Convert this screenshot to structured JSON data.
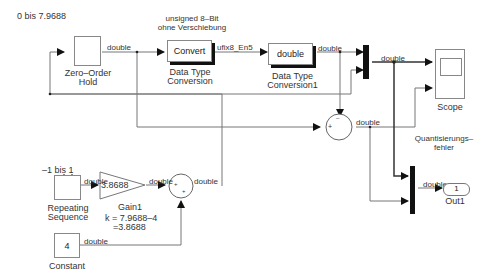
{
  "diagram": {
    "annotations": {
      "range_top": "0 bis 7.9688",
      "conversion_note_1": "unsigned 8–Bit",
      "conversion_note_2": "ohne Verschiebung",
      "range_bottom": "–1 bis 1",
      "gain_formula_1": "k = 7.9688–4",
      "gain_formula_2": "=3.8688",
      "error_label_1": "Quantisierungs–",
      "error_label_2": "fehler"
    },
    "blocks": {
      "zoh": {
        "name_1": "Zero–Order",
        "name_2": "Hold"
      },
      "dtc": {
        "content": "Convert",
        "name_1": "Data Type",
        "name_2": "Conversion"
      },
      "dtc1": {
        "content": "double",
        "name_1": "Data Type",
        "name_2": "Conversion1"
      },
      "scope": {
        "name": "Scope"
      },
      "repeating": {
        "name_1": "Repeating",
        "name_2": "Sequence"
      },
      "gain": {
        "content": "3.8688",
        "name": "Gain1"
      },
      "constant": {
        "content": "4",
        "name": "Constant"
      },
      "out": {
        "content": "1",
        "name": "Out1"
      },
      "sum_top_signs": {
        "minus": "–",
        "plus": "+"
      },
      "sum_bottom_signs": {
        "plus1": "+",
        "plus2": "+"
      }
    },
    "signals": {
      "zoh_out": "double",
      "dtc_out": "ufix8_En5",
      "dtc1_out": "double",
      "mux_out": "double",
      "sum_out": "double",
      "rep_out": "double",
      "gain_out": "double",
      "sum2_out": "double",
      "const_out": "double",
      "mux2_out": "double"
    }
  }
}
